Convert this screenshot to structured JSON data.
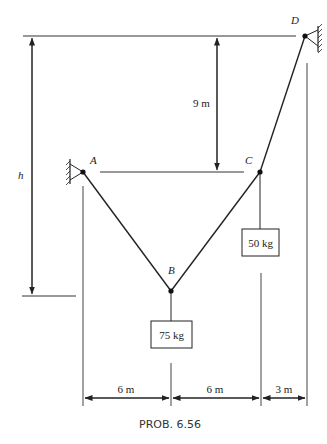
{
  "figure": {
    "caption": "PROB. 6.56",
    "points": {
      "A": "A",
      "B": "B",
      "C": "C",
      "D": "D"
    },
    "masses": {
      "at_B": "75 kg",
      "at_C": "50 kg"
    },
    "dimensions": {
      "vertical_D_to_AC": "9 m",
      "vertical_total": "h",
      "horizontal_A_to_B": "6 m",
      "horizontal_B_to_C": "6 m",
      "horizontal_C_to_D": "3 m"
    },
    "colors": {
      "line": "#222222",
      "background": "#ffffff"
    }
  }
}
